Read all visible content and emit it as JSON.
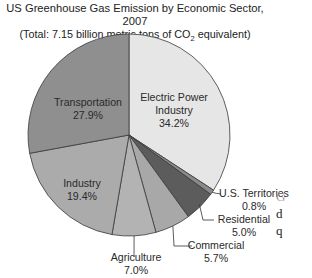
{
  "title": {
    "line1": "US Greenhouse Gas Emission by Economic Sector, 2007",
    "line2_prefix": "(Total: 7.15 billion metric tons of CO",
    "line2_sub": "2",
    "line2_suffix": " equivalent)"
  },
  "side_text": [
    "G",
    "d",
    "q"
  ],
  "colors": {
    "electric_power": "#e6e6e6",
    "us_territories": "#8a8a8a",
    "residential": "#5c5c5c",
    "commercial": "#a8a8a8",
    "agriculture": "#b3b3b3",
    "industry": "#ababab",
    "transportation": "#8f8f8f",
    "stroke": "#3a3a3a"
  },
  "chart_data": {
    "type": "pie",
    "title": "US Greenhouse Gas Emission by Economic Sector, 2007",
    "subtitle": "(Total: 7.15 billion metric tons of CO2 equivalent)",
    "start_angle": "12 o'clock",
    "direction": "clockwise",
    "categories": [
      "Electric Power Industry",
      "U.S. Territories",
      "Residential",
      "Commercial",
      "Agriculture",
      "Industry",
      "Transportation"
    ],
    "values": [
      34.2,
      0.8,
      5.0,
      5.7,
      7.0,
      19.4,
      27.9
    ],
    "unit": "%",
    "labels": [
      {
        "name": "Electric Power Industry",
        "lines": [
          "Electric Power",
          "Industry",
          "34.2%"
        ],
        "placement": "inside"
      },
      {
        "name": "U.S. Territories",
        "lines": [
          "U.S. Territories",
          "0.8%"
        ],
        "placement": "callout"
      },
      {
        "name": "Residential",
        "lines": [
          "Residential",
          "5.0%"
        ],
        "placement": "callout"
      },
      {
        "name": "Commercial",
        "lines": [
          "Commercial",
          "5.7%"
        ],
        "placement": "callout"
      },
      {
        "name": "Agriculture",
        "lines": [
          "Agriculture",
          "7.0%"
        ],
        "placement": "callout"
      },
      {
        "name": "Industry",
        "lines": [
          "Industry",
          "19.4%"
        ],
        "placement": "inside"
      },
      {
        "name": "Transportation",
        "lines": [
          "Transportation",
          "27.9%"
        ],
        "placement": "inside"
      }
    ]
  }
}
